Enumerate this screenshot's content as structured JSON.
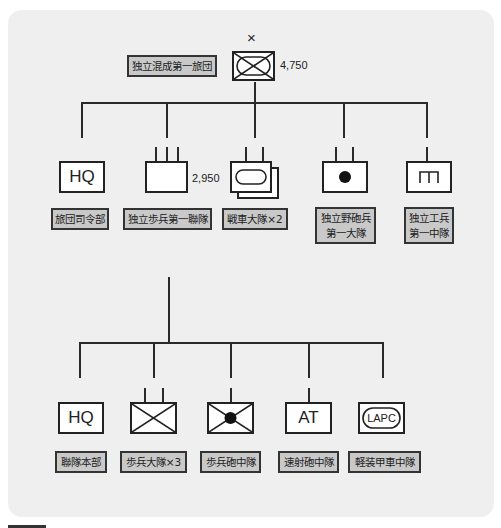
{
  "diagram": {
    "type": "military-organization-chart",
    "top": {
      "name": "独立混成第一旅団",
      "echelon_mark": "×",
      "strength": "4,750",
      "symbol": "armored-infantry-x-box"
    },
    "level2": [
      {
        "id": "brigade-hq",
        "name": "旅団司令部",
        "symbol_text": "HQ",
        "symbol": "hq-box"
      },
      {
        "id": "infantry-regiment",
        "name": "独立歩兵第一聯隊",
        "strength": "2,950",
        "symbol": "regiment-box-three-ticks"
      },
      {
        "id": "tank-battalions",
        "name": "戦車大隊×2",
        "symbol": "armor-oval-stacked"
      },
      {
        "id": "field-artillery",
        "name_line1": "独立野砲兵",
        "name_line2": "第一大隊",
        "symbol": "artillery-dot"
      },
      {
        "id": "engineers",
        "name_line1": "独立工兵",
        "name_line2": "第一中隊",
        "symbol": "engineer-bracket"
      }
    ],
    "level3": [
      {
        "id": "regiment-hq",
        "name": "聯隊本部",
        "symbol_text": "HQ",
        "symbol": "hq-box"
      },
      {
        "id": "infantry-battalions",
        "name": "歩兵大隊×3",
        "symbol": "infantry-x-two-ticks"
      },
      {
        "id": "infantry-gun-company",
        "name": "歩兵砲中隊",
        "symbol": "infantry-x-dot"
      },
      {
        "id": "at-company",
        "name": "速射砲中隊",
        "symbol_text": "AT",
        "symbol": "at-box"
      },
      {
        "id": "lapc-company",
        "name": "軽装甲車中隊",
        "symbol_text": "LAPC",
        "symbol": "lapc-oval"
      }
    ],
    "colors": {
      "panel": "#efefef",
      "label_fill": "#c9c9c9",
      "line": "#2a2a2a",
      "symbol_fill": "#ffffff"
    }
  }
}
